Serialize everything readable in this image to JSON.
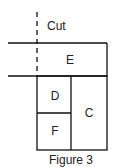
{
  "diagram": {
    "cut_label": "Cut",
    "caption": "Figure 3",
    "regions": [
      {
        "id": "E",
        "label": "E"
      },
      {
        "id": "D",
        "label": "D"
      },
      {
        "id": "C",
        "label": "C"
      },
      {
        "id": "F",
        "label": "F"
      }
    ],
    "colors": {
      "line": "#111111",
      "background": "#ffffff"
    }
  }
}
